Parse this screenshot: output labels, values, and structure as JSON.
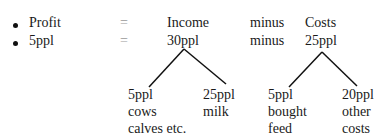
{
  "rows": [
    {
      "bullet": "•",
      "left": "Profit",
      "eq": "=",
      "middle": "Income",
      "op": "minus",
      "right": "Costs"
    },
    {
      "bullet": "•",
      "left": "5ppl",
      "eq": "=",
      "middle": "30ppl",
      "op": "minus",
      "right": "25ppl"
    }
  ],
  "income_branches": [
    {
      "lines": [
        "5ppl",
        "cows",
        "calves etc."
      ]
    },
    {
      "lines": [
        "25ppl",
        "milk"
      ]
    }
  ],
  "cost_branches": [
    {
      "lines": [
        "5ppl",
        "bought",
        "feed"
      ]
    },
    {
      "lines": [
        "20ppl",
        "other",
        "costs"
      ]
    }
  ]
}
